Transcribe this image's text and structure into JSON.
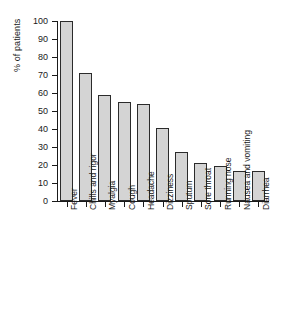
{
  "chart_data": {
    "type": "bar",
    "title": "",
    "subtitle": "",
    "xlabel": "",
    "ylabel": "% of patients",
    "ylim": [
      0,
      100
    ],
    "ytick_step": 10,
    "yticks": [
      0,
      10,
      20,
      30,
      40,
      50,
      60,
      70,
      80,
      90,
      100
    ],
    "grid": false,
    "legend": null,
    "orientation": "vertical",
    "bar_color": "#d4d4d4",
    "bar_edge_color": "#2b2b2b",
    "axis_color": "#1a1a1a",
    "background": "#ffffff",
    "categories": [
      "Fever",
      "Chills and rigor",
      "Myalgia",
      "Cough",
      "Headache",
      "Dizziness",
      "Sputum",
      "Sore throat",
      "Running nose",
      "Nausea and vomiting",
      "Diarrhea"
    ],
    "values": [
      100,
      71,
      59,
      55,
      54,
      40.5,
      27,
      21,
      19.5,
      16.5,
      16.5
    ]
  }
}
